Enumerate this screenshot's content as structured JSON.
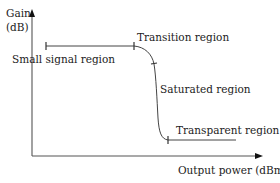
{
  "diagram": {
    "title": "",
    "axes": {
      "y_label_line1": "Gain",
      "y_label_line2": "(dB)",
      "x_label": "Output power (dBm)"
    },
    "regions": [
      {
        "name": "small-signal",
        "label": "Small signal region"
      },
      {
        "name": "transition",
        "label": "Transition region"
      },
      {
        "name": "saturated",
        "label": "Saturated region"
      },
      {
        "name": "transparent",
        "label": "Transparent region"
      }
    ],
    "colors": {
      "line": "#444444",
      "axis": "#555555",
      "text": "#222222",
      "background": "#ffffff"
    }
  }
}
